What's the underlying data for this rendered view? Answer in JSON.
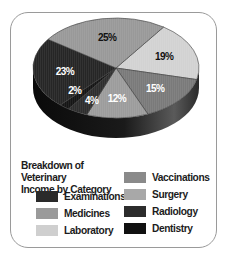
{
  "chart_data": {
    "type": "pie",
    "style": "3d",
    "title": "Breakdown of Veterinary Income by Category",
    "title_lines": [
      "Breakdown of Veterinary",
      "Income by Category"
    ],
    "unit": "%",
    "slices": [
      {
        "name": "Laboratory",
        "value": 19,
        "label": "19%",
        "color": "#d2d2d2",
        "label_color": "#111111"
      },
      {
        "name": "Vaccinations",
        "value": 15,
        "label": "15%",
        "color": "#7a7a7a",
        "label_color": "#ffffff"
      },
      {
        "name": "Surgery",
        "value": 12,
        "label": "12%",
        "color": "#9c9c9c",
        "label_color": "#ffffff"
      },
      {
        "name": "Radiology",
        "value": 4,
        "label": "4%",
        "color": "#2e2e2e",
        "label_color": "#ffffff"
      },
      {
        "name": "Dentistry",
        "value": 2,
        "label": "2%",
        "color": "#151515",
        "label_color": "#ffffff"
      },
      {
        "name": "Examinations",
        "value": 23,
        "label": "23%",
        "color": "#262626",
        "label_color": "#ffffff"
      },
      {
        "name": "Medicines",
        "value": 25,
        "label": "25%",
        "color": "#999999",
        "label_color": "#111111"
      }
    ],
    "legend": {
      "position": "bottom",
      "columns": [
        [
          "Examinations",
          "Medicines",
          "Laboratory"
        ],
        [
          "Vaccinations",
          "Surgery",
          "Radiology",
          "Dentistry"
        ]
      ]
    }
  },
  "legend_items": [
    {
      "label": "Examinations",
      "color": "#2a2a2a"
    },
    {
      "label": "Medicines",
      "color": "#9a9a9a"
    },
    {
      "label": "Laboratory",
      "color": "#cfcfcf"
    },
    {
      "label": "Vaccinations",
      "color": "#8a8a8a"
    },
    {
      "label": "Surgery",
      "color": "#a8a8a8"
    },
    {
      "label": "Radiology",
      "color": "#2c2c2c"
    },
    {
      "label": "Dentistry",
      "color": "#111111"
    }
  ]
}
